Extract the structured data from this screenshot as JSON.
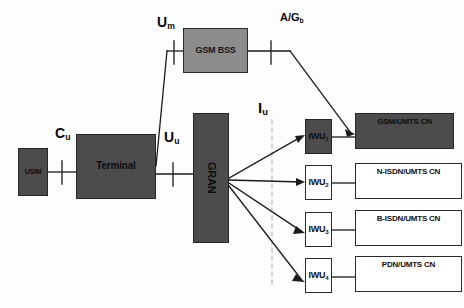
{
  "diagram": {
    "colors": {
      "dark_fill": "#4c4c4c",
      "mid_fill": "#8c8c8c",
      "light_fill": "#ffffff",
      "line": "#1c1c1c",
      "dashed_line": "#b9b9a8",
      "background": "#fdfdfd"
    },
    "nodes": [
      {
        "id": "usim",
        "label": "USIM",
        "fill": "dark",
        "x": 18,
        "y": 148,
        "w": 30,
        "h": 48
      },
      {
        "id": "terminal",
        "label": "Terminal",
        "fill": "dark",
        "x": 76,
        "y": 134,
        "w": 80,
        "h": 65
      },
      {
        "id": "gsmbss",
        "label": "GSM BSS",
        "fill": "mid",
        "x": 183,
        "y": 28,
        "w": 65,
        "h": 45
      },
      {
        "id": "gran",
        "label": "GRAN",
        "fill": "dark",
        "x": 193,
        "y": 113,
        "w": 36,
        "h": 130
      },
      {
        "id": "iwu1",
        "label": "IWU",
        "sub": "1",
        "fill": "dark",
        "x": 305,
        "y": 119,
        "w": 27,
        "h": 35
      },
      {
        "id": "iwu2",
        "label": "IWU",
        "sub": "2",
        "fill": "light",
        "x": 305,
        "y": 165,
        "w": 27,
        "h": 35
      },
      {
        "id": "iwu3",
        "label": "IWU",
        "sub": "3",
        "fill": "light",
        "x": 305,
        "y": 212,
        "w": 27,
        "h": 35
      },
      {
        "id": "iwu4",
        "label": "IWU",
        "sub": "4",
        "fill": "light",
        "x": 305,
        "y": 258,
        "w": 27,
        "h": 35
      },
      {
        "id": "cn1",
        "label": "GSM/UMTS CN",
        "fill": "dark",
        "x": 355,
        "y": 113,
        "w": 99,
        "h": 36
      },
      {
        "id": "cn2",
        "label": "N-ISDN/UMTS CN",
        "fill": "light",
        "x": 355,
        "y": 163,
        "w": 107,
        "h": 36
      },
      {
        "id": "cn3",
        "label": "B-ISDN/UMTS CN",
        "fill": "light",
        "x": 355,
        "y": 210,
        "w": 107,
        "h": 36
      },
      {
        "id": "cn4",
        "label": "PDN/UMTS CN",
        "fill": "light",
        "x": 355,
        "y": 256,
        "w": 107,
        "h": 36
      }
    ],
    "interfaces": [
      {
        "id": "cu",
        "base": "C",
        "sub": "u",
        "x": 55,
        "y": 126
      },
      {
        "id": "um",
        "base": "U",
        "sub": "m",
        "x": 157,
        "y": 15
      },
      {
        "id": "uu",
        "base": "U",
        "sub": "u",
        "x": 164,
        "y": 130
      },
      {
        "id": "iu",
        "base": "I",
        "sub": "u",
        "x": 255,
        "y": 100
      },
      {
        "id": "agb",
        "base": "A/G",
        "sub": "b",
        "x": 280,
        "y": 12
      }
    ]
  }
}
